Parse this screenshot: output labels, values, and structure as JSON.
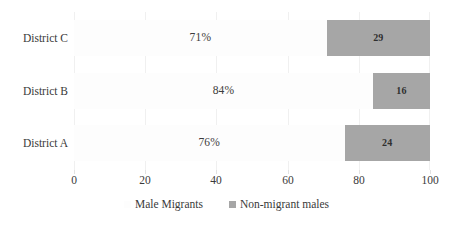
{
  "chart_data": {
    "type": "bar",
    "orientation": "horizontal",
    "stacked": true,
    "title": "",
    "subtitle": "",
    "xlabel": "",
    "ylabel": "",
    "xlim": [
      0,
      100
    ],
    "xticks": [
      0,
      20,
      40,
      60,
      80,
      100
    ],
    "xtick_labels": [
      "0",
      "20",
      "40",
      "60",
      "80",
      "100"
    ],
    "grid": true,
    "grid_axis": "x",
    "legend_position": "bottom-center",
    "categories": [
      "District C",
      "District B",
      "District A"
    ],
    "series": [
      {
        "name": "Male Migrants",
        "color": "#fdfdfd",
        "values": [
          71,
          84,
          76
        ],
        "data_labels": [
          "71%",
          "84%",
          "76%"
        ]
      },
      {
        "name": "Non-migrant males",
        "color": "#a6a6a6",
        "values": [
          29,
          16,
          24
        ],
        "data_labels": [
          "29",
          "16",
          "24"
        ]
      }
    ],
    "legend": [
      {
        "label": "Male Migrants",
        "marker": "square-swatch",
        "color": "#fdfdfd"
      },
      {
        "label": "Non-migrant males",
        "marker": "square-swatch",
        "color": "#a6a6a6"
      }
    ]
  }
}
